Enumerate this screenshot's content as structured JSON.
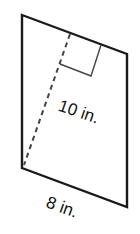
{
  "figure": {
    "shape": "parallelogram",
    "base_label": "8 in.",
    "height_label": "10 in.",
    "stroke_color": "#1a1a1a",
    "background": "#ffffff",
    "vertices": {
      "top_left": [
        22,
        15
      ],
      "top_right": [
        127,
        54
      ],
      "bottom_right": [
        127,
        207
      ],
      "bottom_left": [
        22,
        168
      ]
    },
    "height_segment": {
      "style": "dashed",
      "from": [
        70,
        34
      ],
      "to": [
        24,
        165
      ]
    },
    "right_angle_marker": true
  }
}
